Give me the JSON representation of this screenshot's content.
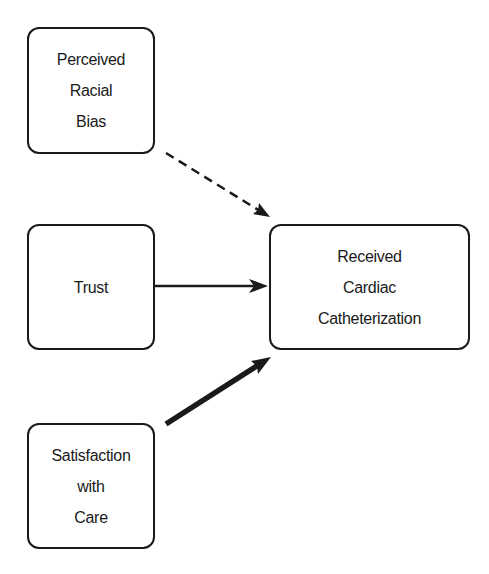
{
  "diagram": {
    "type": "path-diagram",
    "nodes": [
      {
        "id": "bias",
        "lines": [
          "Perceived",
          "Racial",
          "Bias"
        ]
      },
      {
        "id": "trust",
        "lines": [
          "Trust"
        ]
      },
      {
        "id": "satis",
        "lines": [
          "Satisfaction",
          "with",
          "Care"
        ]
      },
      {
        "id": "cath",
        "lines": [
          "Received",
          "Cardiac",
          "Catheterization"
        ]
      }
    ],
    "edges": [
      {
        "from": "bias",
        "to": "cath",
        "style": "dashed"
      },
      {
        "from": "trust",
        "to": "cath",
        "style": "solid"
      },
      {
        "from": "satis",
        "to": "cath",
        "style": "bold"
      }
    ],
    "colors": {
      "stroke": "#1a1a1a",
      "background": "#ffffff"
    }
  }
}
